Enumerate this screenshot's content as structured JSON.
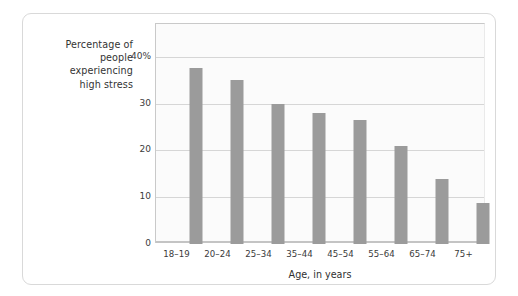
{
  "chart_data": {
    "type": "bar",
    "title": "",
    "ylabel": "Percentage of people experiencing high stress",
    "xlabel": "Age, in years",
    "categories": [
      "18–19",
      "20–24",
      "25–34",
      "35–44",
      "45–54",
      "55–64",
      "65–74",
      "75+"
    ],
    "values": [
      37.5,
      35,
      30,
      28,
      26.5,
      21,
      13.8,
      8.7
    ],
    "ylim": [
      0,
      47
    ],
    "yticks": [
      0,
      10,
      20,
      30,
      40
    ],
    "ytick_labels": [
      "0",
      "10",
      "20",
      "30",
      "40%"
    ],
    "grid": "horizontal",
    "legend": "none",
    "bar_color": "#9b9b9b",
    "grid_color": "#d6d6d6",
    "plot_background": "#fbfbfb",
    "text_color": "#3a3a3a"
  },
  "y_axis_label_lines": [
    "Percentage of",
    "people",
    "experiencing",
    "high stress"
  ]
}
